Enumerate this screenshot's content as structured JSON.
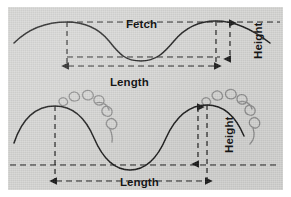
{
  "figure": {
    "type": "wave-anatomy-diagram",
    "background_color": "#ffffff",
    "panel_color": "#d6d6d4",
    "ink_color": "#1a1a1a",
    "foam_color": "#8e8e8e",
    "panels": [
      {
        "name": "upper-wave-diagram",
        "labels": {
          "fetch": "Fetch",
          "length": "Length",
          "height": "Height"
        },
        "annotations": [
          {
            "name": "fetch-line",
            "kind": "dashed-horizontal",
            "level": "crest"
          },
          {
            "name": "trough-line",
            "kind": "dashed-horizontal",
            "level": "trough"
          },
          {
            "name": "length-arrow",
            "kind": "dashed-double-arrow",
            "axis": "horizontal"
          },
          {
            "name": "height-arrow",
            "kind": "dashed-double-arrow",
            "axis": "vertical"
          },
          {
            "name": "crest-drop-line",
            "kind": "dashed-vertical"
          }
        ]
      },
      {
        "name": "lower-wave-diagram",
        "labels": {
          "length": "Length",
          "height": "Height"
        },
        "annotations": [
          {
            "name": "baseline",
            "kind": "dashed-horizontal",
            "level": "trough"
          },
          {
            "name": "length-arrow",
            "kind": "dashed-double-arrow",
            "axis": "horizontal"
          },
          {
            "name": "height-arrow",
            "kind": "dashed-double-arrow",
            "axis": "vertical"
          },
          {
            "name": "crest-drop-line",
            "kind": "dashed-vertical"
          },
          {
            "name": "whitecap-curls",
            "kind": "foam-spirals",
            "count": 10
          }
        ]
      }
    ]
  }
}
